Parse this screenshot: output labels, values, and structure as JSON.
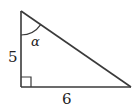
{
  "diagram": {
    "type": "right-triangle",
    "labels": {
      "vertical_side": "5",
      "horizontal_side": "6",
      "angle": "α"
    },
    "colors": {
      "stroke": "#3a3a3a",
      "text": "#222222",
      "background": "#ffffff"
    }
  }
}
